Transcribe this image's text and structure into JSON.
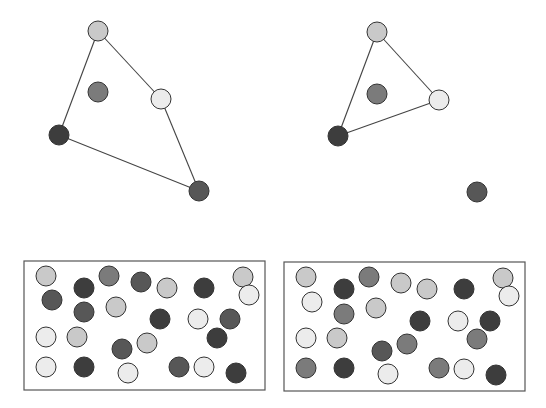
{
  "palette": {
    "light": "#c9c9c9",
    "pale": "#ececec",
    "medium": "#7b7b7b",
    "darkmedium": "#575757",
    "dark": "#3d3d3d"
  },
  "graphs": [
    {
      "name": "graph-left",
      "nodes": [
        {
          "id": "a",
          "shade": "light"
        },
        {
          "id": "b",
          "shade": "medium"
        },
        {
          "id": "c",
          "shade": "pale"
        },
        {
          "id": "d",
          "shade": "dark"
        },
        {
          "id": "e",
          "shade": "darkmedium"
        }
      ],
      "edges": [
        [
          "a",
          "c"
        ],
        [
          "c",
          "e"
        ],
        [
          "e",
          "d"
        ],
        [
          "d",
          "a"
        ]
      ]
    },
    {
      "name": "graph-right",
      "nodes": [
        {
          "id": "a",
          "shade": "light"
        },
        {
          "id": "b",
          "shade": "medium"
        },
        {
          "id": "c",
          "shade": "pale"
        },
        {
          "id": "d",
          "shade": "dark"
        },
        {
          "id": "e",
          "shade": "darkmedium"
        }
      ],
      "edges": [
        [
          "a",
          "c"
        ],
        [
          "c",
          "d"
        ],
        [
          "d",
          "a"
        ]
      ]
    }
  ],
  "boxes": [
    {
      "name": "box-left",
      "shades": [
        "light",
        "dark",
        "medium",
        "darkmedium",
        "light",
        "dark",
        "light",
        "pale",
        "darkmedium",
        "darkmedium",
        "light",
        "dark",
        "pale",
        "darkmedium",
        "dark",
        "pale",
        "light",
        "darkmedium",
        "light",
        "pale",
        "dark",
        "pale",
        "darkmedium",
        "pale",
        "dark"
      ]
    },
    {
      "name": "box-right",
      "shades": [
        "light",
        "dark",
        "medium",
        "light",
        "light",
        "dark",
        "light",
        "pale",
        "pale",
        "medium",
        "light",
        "dark",
        "pale",
        "dark",
        "medium",
        "pale",
        "light",
        "darkmedium",
        "medium",
        "medium",
        "dark",
        "pale",
        "medium",
        "pale",
        "dark"
      ]
    }
  ]
}
